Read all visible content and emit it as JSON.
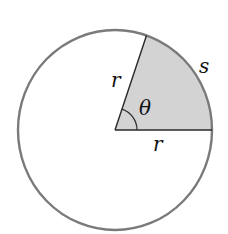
{
  "diagram": {
    "labels": {
      "radius_upper": "r",
      "radius_lower": "r",
      "angle": "θ",
      "arc": "s"
    },
    "colors": {
      "circle_stroke": "#7a7a7a",
      "sector_fill": "#d3d3d3",
      "line": "#2a2a2a",
      "background": "#ffffff"
    }
  }
}
